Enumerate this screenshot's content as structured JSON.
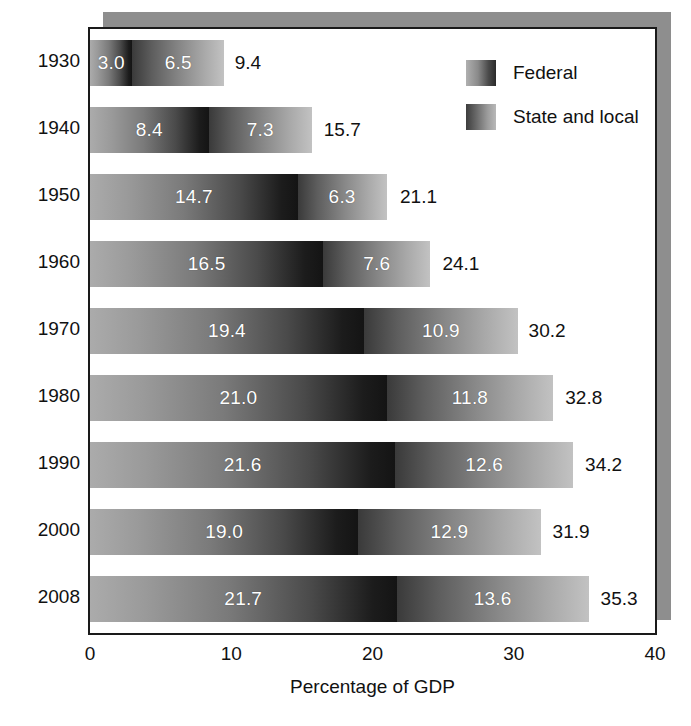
{
  "chart_data": {
    "type": "bar",
    "subtype": "stacked-horizontal",
    "title": "",
    "xlabel": "Percentage of GDP",
    "ylabel": "",
    "xlim": [
      0,
      40
    ],
    "xticks": [
      "0",
      "10",
      "20",
      "30",
      "40"
    ],
    "xtick_values": [
      0,
      10,
      20,
      30,
      40
    ],
    "grid": false,
    "legend_position": "top-right",
    "categories": [
      "1930",
      "1940",
      "1950",
      "1960",
      "1970",
      "1980",
      "1990",
      "2000",
      "2008"
    ],
    "series": [
      {
        "name": "Federal",
        "values": [
          3.0,
          8.4,
          14.7,
          16.5,
          19.4,
          21.0,
          21.6,
          19.0,
          21.7
        ],
        "labels": [
          "3.0",
          "8.4",
          "14.7",
          "16.5",
          "19.4",
          "21.0",
          "21.6",
          "19.0",
          "21.7"
        ]
      },
      {
        "name": "State and local",
        "values": [
          6.5,
          7.3,
          6.3,
          7.6,
          10.9,
          11.8,
          12.6,
          12.9,
          13.6
        ],
        "labels": [
          "6.5",
          "7.3",
          "6.3",
          "7.6",
          "10.9",
          "11.8",
          "12.6",
          "12.9",
          "13.6"
        ]
      }
    ],
    "totals": [
      9.4,
      15.7,
      21.1,
      24.1,
      30.2,
      32.8,
      34.2,
      31.9,
      35.3
    ],
    "total_labels": [
      "9.4",
      "15.7",
      "21.1",
      "24.1",
      "30.2",
      "32.8",
      "34.2",
      "31.9",
      "35.3"
    ],
    "colors": {
      "federal_gradient_start": "#ababab",
      "federal_gradient_end": "#141414",
      "state_gradient_start": "#3a3a3a",
      "state_gradient_end": "#c2c2c2",
      "frame": "#1a1a1a",
      "shadow": "#8e8e8e",
      "background": "#ffffff",
      "inner_label_text": "#ffffff",
      "outer_label_text": "#111111"
    }
  },
  "legend": {
    "items": [
      {
        "label": "Federal",
        "swatch": "federal-gradient-swatch"
      },
      {
        "label": "State and local",
        "swatch": "state-and-local-gradient-swatch"
      }
    ]
  },
  "axis": {
    "x_title": "Percentage of GDP",
    "x_ticks": [
      "0",
      "10",
      "20",
      "30",
      "40"
    ],
    "y_ticks": [
      "1930",
      "1940",
      "1950",
      "1960",
      "1970",
      "1980",
      "1990",
      "2000",
      "2008"
    ]
  }
}
